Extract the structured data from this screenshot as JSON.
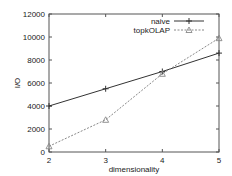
{
  "chart_data": {
    "type": "line",
    "title": "",
    "xlabel": "dimensionality",
    "ylabel": "I/O",
    "x": [
      2,
      3,
      4,
      5
    ],
    "xlim": [
      2,
      5
    ],
    "ylim": [
      0,
      12000
    ],
    "xticks": [
      "2",
      "3",
      "4",
      "5"
    ],
    "yticks": [
      "0",
      "2000",
      "4000",
      "6000",
      "8000",
      "10000",
      "12000"
    ],
    "grid": false,
    "legend_position": "top-right",
    "series": [
      {
        "name": "naive",
        "marker": "plus",
        "line": "solid",
        "color": "#333333",
        "values": [
          4000,
          5500,
          7000,
          8600
        ]
      },
      {
        "name": "topkOLAP",
        "marker": "triangle",
        "line": "dotted",
        "color": "#888888",
        "values": [
          500,
          2800,
          6800,
          9900
        ]
      }
    ]
  }
}
